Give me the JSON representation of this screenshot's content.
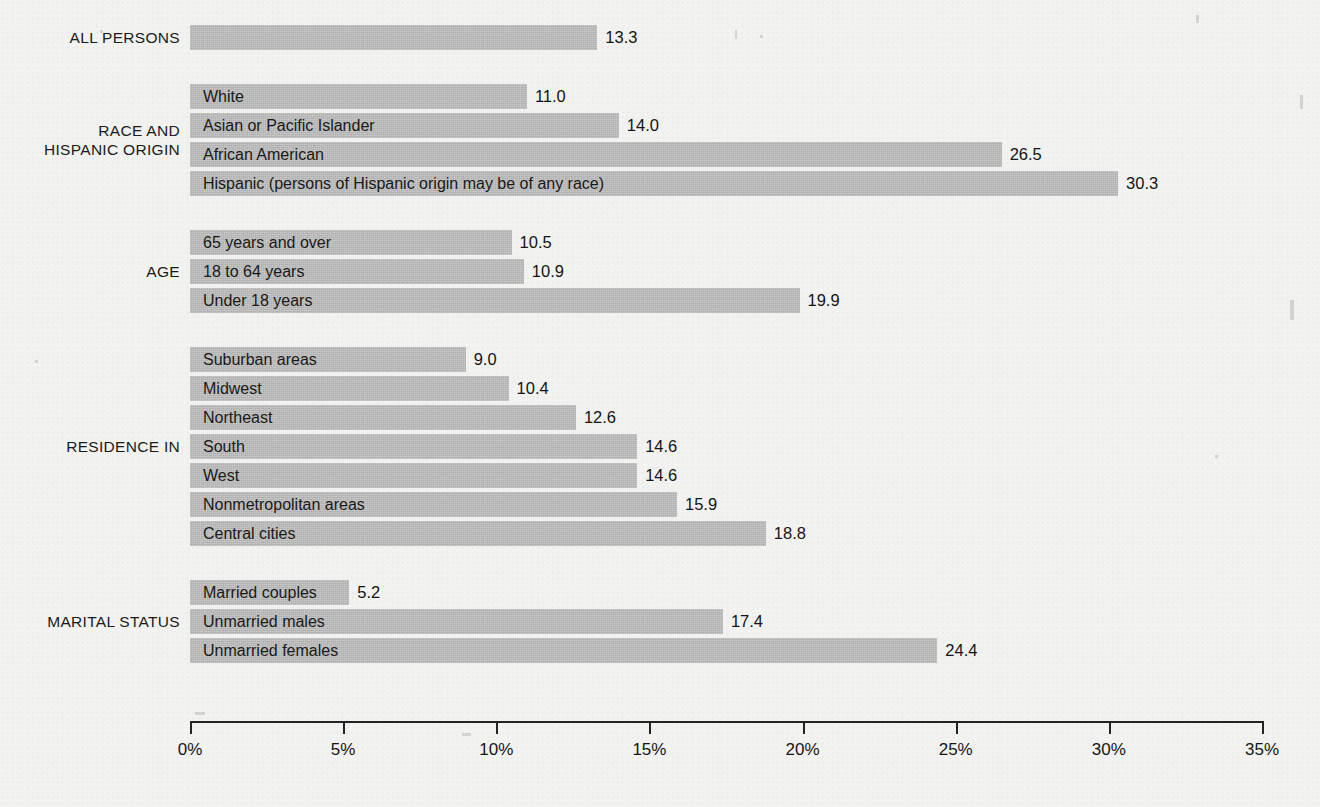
{
  "chart_data": {
    "type": "bar",
    "orientation": "horizontal",
    "title": "",
    "xlabel": "",
    "ylabel": "",
    "xlim": [
      0,
      35
    ],
    "xtick_labels": [
      "0%",
      "5%",
      "10%",
      "15%",
      "20%",
      "25%",
      "30%",
      "35%"
    ],
    "xticks": [
      0,
      5,
      10,
      15,
      20,
      25,
      30,
      35
    ],
    "grid": false,
    "legend": "none",
    "bar_color": "#bcbcbc",
    "background_color": "#f2f2f0",
    "groups": [
      {
        "group_label": "ALL PERSONS",
        "bars": [
          {
            "label": "",
            "value": 13.3,
            "value_text": "13.3"
          }
        ]
      },
      {
        "group_label": "RACE AND\nHISPANIC ORIGIN",
        "bars": [
          {
            "label": "White",
            "value": 11.0,
            "value_text": "11.0"
          },
          {
            "label": "Asian or Pacific Islander",
            "value": 14.0,
            "value_text": "14.0"
          },
          {
            "label": "African American",
            "value": 26.5,
            "value_text": "26.5"
          },
          {
            "label": "Hispanic (persons of Hispanic origin may be of any race)",
            "value": 30.3,
            "value_text": "30.3"
          }
        ]
      },
      {
        "group_label": "AGE",
        "bars": [
          {
            "label": "65 years and over",
            "value": 10.5,
            "value_text": "10.5"
          },
          {
            "label": "18 to 64 years",
            "value": 10.9,
            "value_text": "10.9"
          },
          {
            "label": "Under 18 years",
            "value": 19.9,
            "value_text": "19.9"
          }
        ]
      },
      {
        "group_label": "RESIDENCE IN",
        "bars": [
          {
            "label": "Suburban areas",
            "value": 9.0,
            "value_text": "9.0"
          },
          {
            "label": "Midwest",
            "value": 10.4,
            "value_text": "10.4"
          },
          {
            "label": "Northeast",
            "value": 12.6,
            "value_text": "12.6"
          },
          {
            "label": "South",
            "value": 14.6,
            "value_text": "14.6"
          },
          {
            "label": "West",
            "value": 14.6,
            "value_text": "14.6"
          },
          {
            "label": "Nonmetropolitan areas",
            "value": 15.9,
            "value_text": "15.9"
          },
          {
            "label": "Central cities",
            "value": 18.8,
            "value_text": "18.8"
          }
        ]
      },
      {
        "group_label": "MARITAL STATUS",
        "bars": [
          {
            "label": "Married couples",
            "value": 5.2,
            "value_text": "5.2"
          },
          {
            "label": "Unmarried males",
            "value": 17.4,
            "value_text": "17.4"
          },
          {
            "label": "Unmarried females",
            "value": 24.4,
            "value_text": "24.4"
          }
        ]
      }
    ]
  }
}
